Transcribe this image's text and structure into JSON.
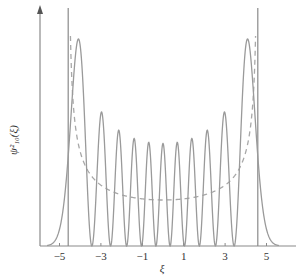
{
  "chart_data": {
    "type": "line",
    "title": "",
    "xlabel": "ξ",
    "ylabel": "ψ²₁₀(ξ)",
    "xlim": [
      -6.0,
      6.4
    ],
    "ylim": [
      0,
      1
    ],
    "grid": false,
    "legend": null,
    "x_ticks": [
      -5,
      -3,
      -1,
      1,
      3,
      5
    ],
    "x_tick_labels": [
      "−5",
      "−3",
      "−1",
      "1",
      "3",
      "5"
    ],
    "quantum_number": 10,
    "classical_turning_points": [
      -4.58,
      4.58
    ],
    "series": [
      {
        "name": "quantum probability density ψ²₁₀(ξ)",
        "style": "solid",
        "color": "#9a9a9a",
        "peak_positions": [
          -4.2,
          -2.2,
          -1.5,
          -0.75,
          0,
          0.75,
          1.5,
          2.2,
          -3.0,
          3.0,
          4.2
        ],
        "relative_peak_heights_approx": {
          "outer": 1.0,
          "second": 0.64,
          "center": 0.46
        }
      },
      {
        "name": "classical probability density",
        "style": "dashed",
        "color": "#a8a8a8",
        "min_at_center_relative": 0.22
      },
      {
        "name": "classical turning points",
        "style": "vertical-lines",
        "color": "#8a8a8a",
        "x": [
          -4.58,
          4.58
        ]
      }
    ]
  },
  "layout": {
    "origin_px": 163,
    "px_per_unit": 20.7,
    "baseline_px": 246,
    "quantum_peak_px": 207,
    "classical_min_px": 46,
    "yaxis_x_px": 40,
    "yaxis_top_px": 5,
    "xaxis_end_px": 296,
    "turning_line_top_px": 8
  }
}
